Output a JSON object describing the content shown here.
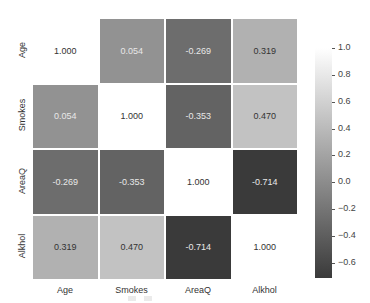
{
  "chart_data": {
    "type": "heatmap",
    "title": "",
    "xlabel": "",
    "ylabel": "",
    "x_categories": [
      "Age",
      "Smokes",
      "AreaQ",
      "Alkhol"
    ],
    "y_categories": [
      "Age",
      "Smokes",
      "AreaQ",
      "Alkhol"
    ],
    "values": [
      [
        1.0,
        0.054,
        -0.269,
        0.319
      ],
      [
        0.054,
        1.0,
        -0.353,
        0.47
      ],
      [
        -0.269,
        -0.353,
        1.0,
        -0.714
      ],
      [
        0.319,
        0.47,
        -0.714,
        1.0
      ]
    ],
    "value_labels": [
      [
        "1.000",
        "0.054",
        "-0.269",
        "0.319"
      ],
      [
        "0.054",
        "1.000",
        "-0.353",
        "0.470"
      ],
      [
        "-0.269",
        "-0.353",
        "1.000",
        "-0.714"
      ],
      [
        "0.319",
        "0.470",
        "-0.714",
        "1.000"
      ]
    ],
    "colormap": "gray",
    "colorbar": {
      "range": [
        -0.714,
        1.0
      ],
      "ticks": [
        "1.0",
        "0.8",
        "0.6",
        "0.4",
        "0.2",
        "0.0",
        "−0.2",
        "−0.4",
        "−0.6"
      ],
      "tick_values": [
        1.0,
        0.8,
        0.6,
        0.4,
        0.2,
        0.0,
        -0.2,
        -0.4,
        -0.6
      ]
    },
    "grid": false,
    "legend_position": "right"
  },
  "colors": {
    "high": "#ffffff",
    "low": "#3a3a3a",
    "text_light": "#e8e8e8",
    "text_dark": "#333333"
  }
}
